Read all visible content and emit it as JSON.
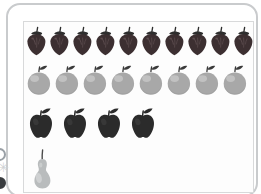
{
  "chart_data": {
    "type": "bar",
    "subtype": "pictograph",
    "title": "",
    "subtitle": "",
    "xlabel": "",
    "ylabel": "",
    "grid": false,
    "legend": false,
    "orientation": "horizontal",
    "unit_value": 1,
    "categories": [
      "strawberry",
      "orange",
      "apple",
      "pear"
    ],
    "values": [
      10,
      8,
      4,
      1
    ],
    "xlim": [
      0,
      10
    ],
    "series": [
      {
        "name": "fruit count",
        "values": [
          10,
          8,
          4,
          1
        ]
      }
    ],
    "rows": [
      {
        "category": "strawberry",
        "icon": "strawberry-icon",
        "count": 10,
        "body_color": "#3c2f31",
        "stem_color": "#2e2e2e",
        "highlight_color": "#6b5a5c"
      },
      {
        "category": "orange",
        "icon": "orange-icon",
        "count": 8,
        "body_color": "#a8a8a8",
        "stem_color": "#3a3a3a",
        "highlight_color": "#cacaca"
      },
      {
        "category": "apple",
        "icon": "apple-icon",
        "count": 4,
        "body_color": "#2b2b2b",
        "stem_color": "#2b2b2b",
        "highlight_color": "#4a4a4a"
      },
      {
        "category": "pear",
        "icon": "pear-icon",
        "count": 1,
        "body_color": "#b9bcbd",
        "stem_color": "#4a4a4a",
        "highlight_color": "#d8dadb"
      }
    ]
  },
  "frame": {
    "border_color": "#c9cbcd",
    "panel_border_color": "#d8d9da",
    "background": "#ffffff"
  },
  "decorations": {
    "edge_dot_top": "circle-outline-icon",
    "edge_dot_bottom": "circle-filled-icon",
    "edge_star": "✳"
  },
  "labels": {
    "row_strawberry": "strawberry",
    "row_orange": "orange",
    "row_apple": "apple",
    "row_pear": "pear",
    "count_strawberry": "10",
    "count_orange": "8",
    "count_apple": "4",
    "count_pear": "1"
  }
}
